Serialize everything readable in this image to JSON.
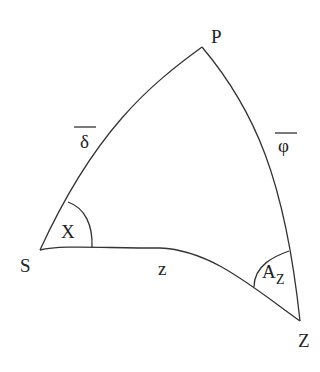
{
  "diagram": {
    "type": "spherical-triangle",
    "vertices": [
      {
        "id": "P",
        "label": "P",
        "x": 202,
        "y": 47
      },
      {
        "id": "S",
        "label": "S",
        "x": 40,
        "y": 250
      },
      {
        "id": "Z",
        "label": "Z",
        "x": 300,
        "y": 321
      }
    ],
    "sides": {
      "PS": {
        "label": "δ",
        "overline": true
      },
      "PZ": {
        "label": "φ",
        "overline": true
      },
      "SZ": {
        "label": "z",
        "overline": false
      }
    },
    "angles": {
      "S": {
        "label": "X"
      },
      "Z": {
        "label": "A",
        "subscript": "Z"
      }
    },
    "colors": {
      "stroke": "#333333",
      "text": "#222222",
      "background": "#ffffff"
    }
  }
}
